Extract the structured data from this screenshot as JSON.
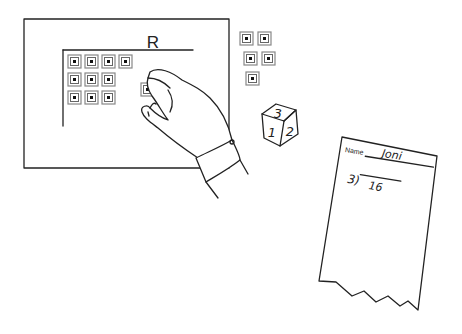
{
  "board": {
    "label": "R",
    "grid_rows": [
      4,
      3,
      3
    ],
    "held_tiles": 1
  },
  "loose_tiles": {
    "count": 5
  },
  "die": {
    "top": "3",
    "left": "1",
    "right": "2"
  },
  "worksheet": {
    "name_label": "Name",
    "name_value": "Joni",
    "divisor": "3)",
    "dividend": "16"
  },
  "colors": {
    "line": "#222222",
    "tile_border": "#888888",
    "background": "#ffffff"
  }
}
